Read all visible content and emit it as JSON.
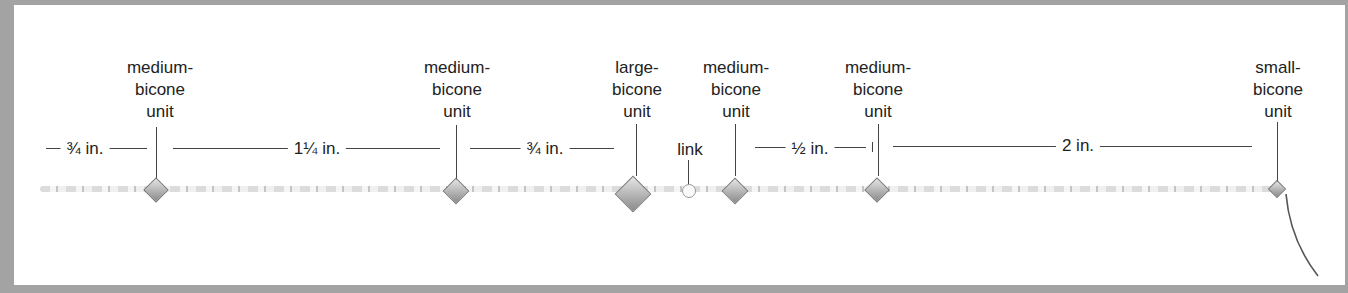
{
  "figure": {
    "units": [
      {
        "id": "u1",
        "lines": [
          "medium-",
          "bicone",
          "unit"
        ],
        "x": 160,
        "size": "medium"
      },
      {
        "id": "u2",
        "lines": [
          "medium-",
          "bicone",
          "unit"
        ],
        "x": 457,
        "size": "medium"
      },
      {
        "id": "u3",
        "lines": [
          "large-",
          "bicone",
          "unit"
        ],
        "x": 637,
        "size": "large"
      },
      {
        "id": "u4",
        "lines": [
          "medium-",
          "bicone",
          "unit"
        ],
        "x": 736,
        "size": "medium"
      },
      {
        "id": "u5",
        "lines": [
          "medium-",
          "bicone",
          "unit"
        ],
        "x": 878,
        "size": "medium"
      },
      {
        "id": "u6",
        "lines": [
          "small-",
          "bicone",
          "unit"
        ],
        "x": 1278,
        "size": "small"
      }
    ],
    "link_label": "link",
    "dimensions": [
      {
        "label": "¾ in.",
        "x1": 46,
        "x2": 147,
        "center": 85
      },
      {
        "label": "1¼ in.",
        "x1": 173,
        "x2": 440,
        "center": 317
      },
      {
        "label": "¾ in.",
        "x1": 470,
        "x2": 614,
        "center": 545
      },
      {
        "label": "½ in.",
        "x1": 755,
        "x2": 866,
        "center": 810
      },
      {
        "label": "2 in.",
        "x1": 893,
        "x2": 1252,
        "center": 1078
      }
    ]
  }
}
